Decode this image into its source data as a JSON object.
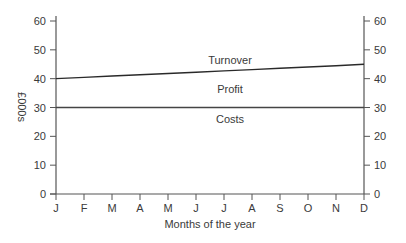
{
  "chart_data": {
    "type": "line",
    "title": "",
    "xlabel": "Months of the year",
    "ylabel": "£000s",
    "x": [
      "J",
      "F",
      "M",
      "A",
      "M",
      "J",
      "J",
      "A",
      "S",
      "O",
      "N",
      "D"
    ],
    "ylim": [
      0,
      60
    ],
    "yticks": [
      0,
      10,
      20,
      30,
      40,
      50,
      60
    ],
    "right_axis": true,
    "grid": false,
    "legend": "none",
    "series": [
      {
        "name": "Turnover",
        "values": [
          40,
          40.45,
          40.9,
          41.35,
          41.8,
          42.25,
          42.7,
          43.15,
          43.6,
          44.05,
          44.5,
          45
        ]
      },
      {
        "name": "Costs",
        "values": [
          30,
          30,
          30,
          30,
          30,
          30,
          30,
          30,
          30,
          30,
          30,
          30
        ]
      }
    ],
    "annotations": [
      {
        "text": "Turnover",
        "x": "J-Jul",
        "y": 46.5
      },
      {
        "text": "Profit",
        "x": "J-Jul",
        "y": 37.5
      },
      {
        "text": "Costs",
        "x": "J-Jul",
        "y": 27.5
      }
    ]
  },
  "labels": {
    "xlabel": "Months of the year",
    "ylabel": "£000s",
    "turnover": "Turnover",
    "profit": "Profit",
    "costs": "Costs"
  },
  "colors": {
    "axis": "#555555",
    "turnover_line": "#2a2a2a",
    "costs_line": "#444444",
    "text": "#3a3a3a"
  }
}
